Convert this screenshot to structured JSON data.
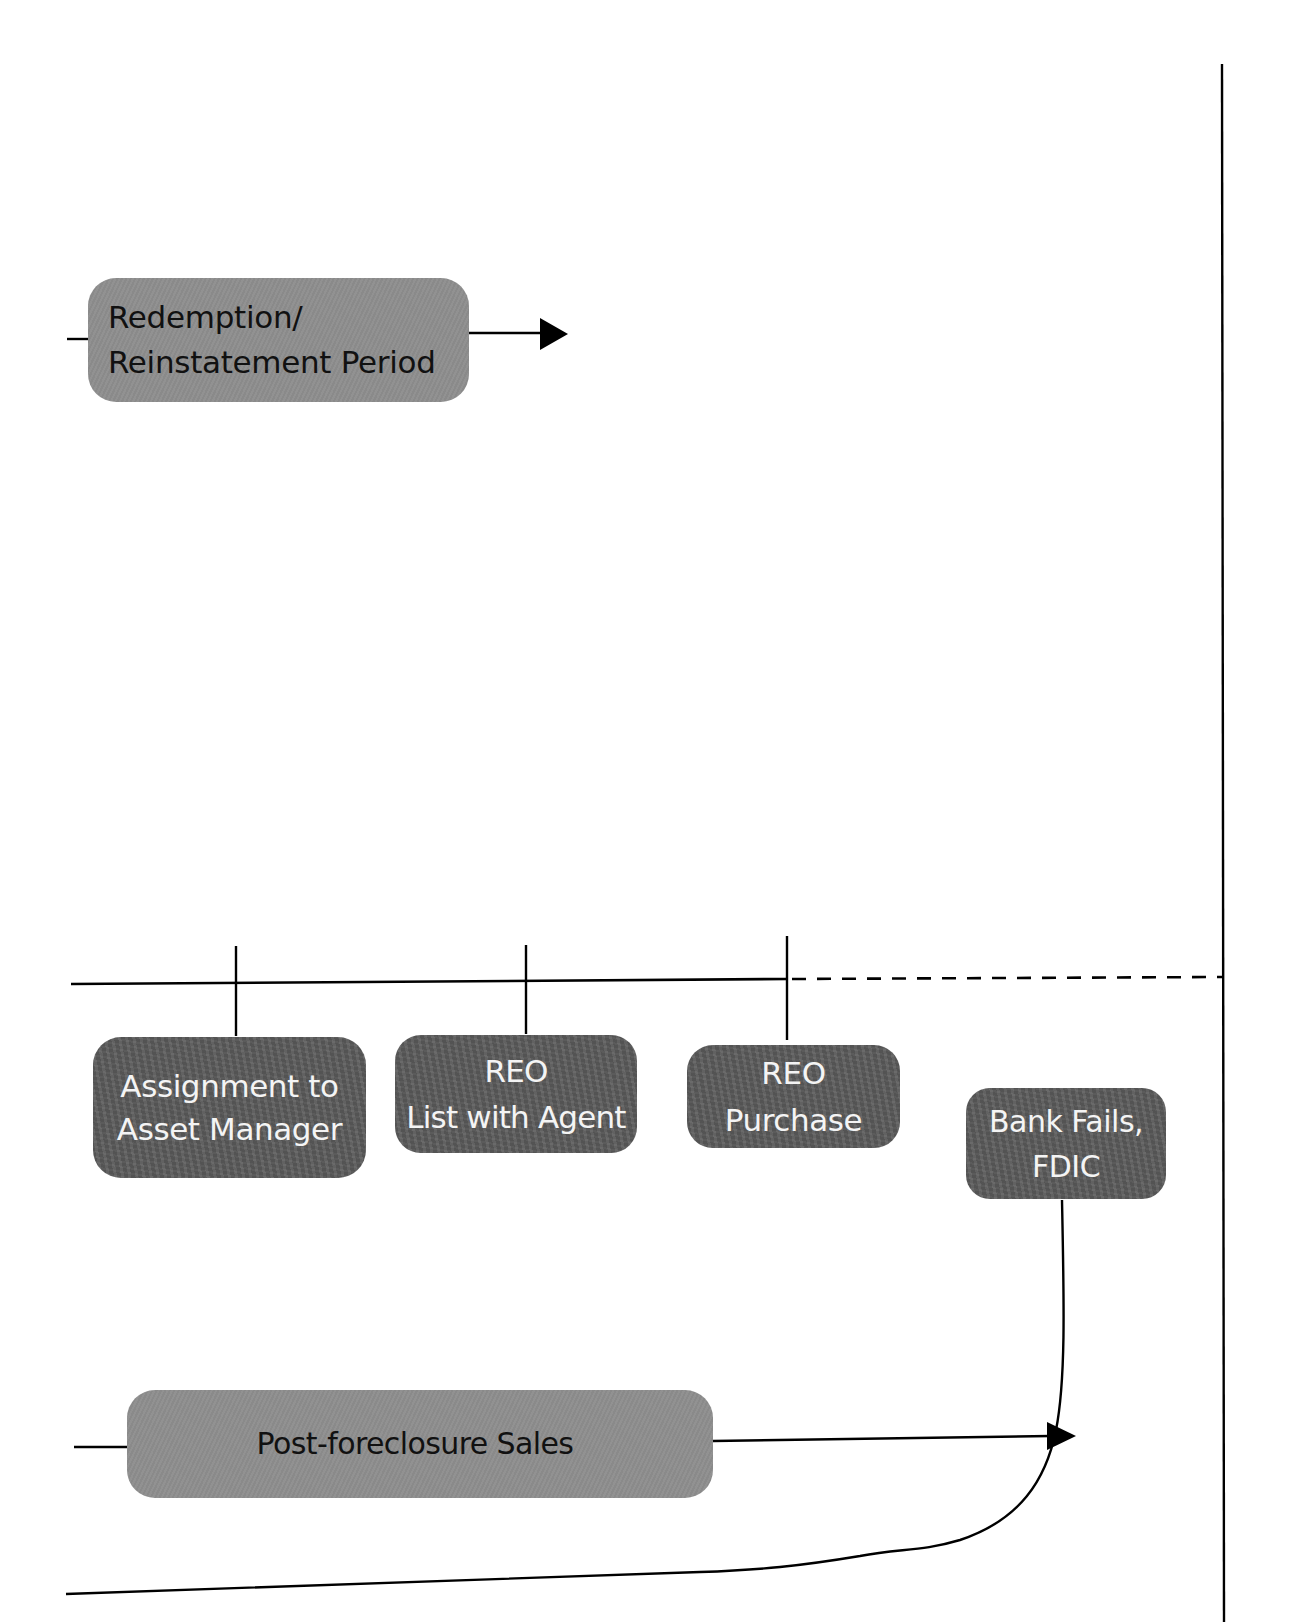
{
  "diagram": {
    "type": "process-flow",
    "colors": {
      "line": "#000000",
      "light_node_fill": "#8e8e8e",
      "light_node_text": "#111111",
      "dark_node_fill": "#5d5d5d",
      "dark_node_text": "#f4f4f4",
      "background": "#ffffff"
    },
    "nodes": {
      "redemption": {
        "style": "light",
        "lines": [
          "Redemption/",
          "Reinstatement Period"
        ]
      },
      "assignment": {
        "style": "dark",
        "lines": [
          "Assignment to",
          "Asset Manager"
        ]
      },
      "reo_list": {
        "style": "dark",
        "lines": [
          "REO",
          "List with Agent"
        ]
      },
      "reo_purchase": {
        "style": "dark",
        "lines": [
          "REO",
          "Purchase"
        ]
      },
      "bank_fails": {
        "style": "dark",
        "lines": [
          "Bank Fails,",
          "FDIC"
        ]
      },
      "post_foreclosure": {
        "style": "light",
        "lines": [
          "Post-foreclosure Sales"
        ]
      }
    },
    "connectors": [
      {
        "from": "left-edge",
        "to": "redemption",
        "style": "solid"
      },
      {
        "from": "redemption",
        "to": "arrow-end",
        "style": "solid-arrow"
      },
      {
        "from": "timeline",
        "to": "assignment",
        "style": "tick"
      },
      {
        "from": "timeline",
        "to": "reo_list",
        "style": "tick"
      },
      {
        "from": "timeline",
        "to": "reo_purchase",
        "style": "tick"
      },
      {
        "from": "reo_purchase-tick",
        "to": "right-boundary",
        "style": "dashed"
      },
      {
        "from": "left-edge",
        "to": "post_foreclosure",
        "style": "solid"
      },
      {
        "from": "post_foreclosure",
        "to": "merge-point",
        "style": "solid-arrow"
      },
      {
        "from": "bank_fails",
        "to": "bottom-line",
        "style": "curved"
      },
      {
        "from": "right-boundary",
        "to": "",
        "style": "vertical-divider"
      }
    ]
  }
}
